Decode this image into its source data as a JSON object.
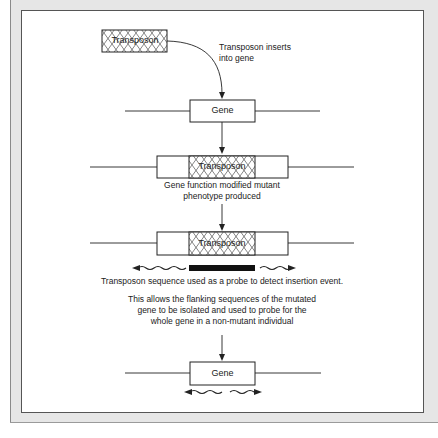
{
  "figure": {
    "caption_top": "Transposon inserts into gene",
    "caption_top_lines": [
      "Transposon inserts",
      "into gene"
    ],
    "transposon_label": "Transposon",
    "gene_label": "Gene",
    "step2_caption_lines": [
      "Gene function modified mutant",
      "phenotype produced"
    ],
    "step3_caption": "Transposon sequence used as a probe to detect insertion event.",
    "step4_caption_lines": [
      "This allows the flanking sequences of the mutated",
      "gene to be isolated and used to probe for the",
      "whole gene in a non-mutant individual"
    ]
  },
  "colors": {
    "frame": "#e6e6e6",
    "panel": "#ffffff",
    "stroke": "#222222",
    "probe": "#111111"
  }
}
